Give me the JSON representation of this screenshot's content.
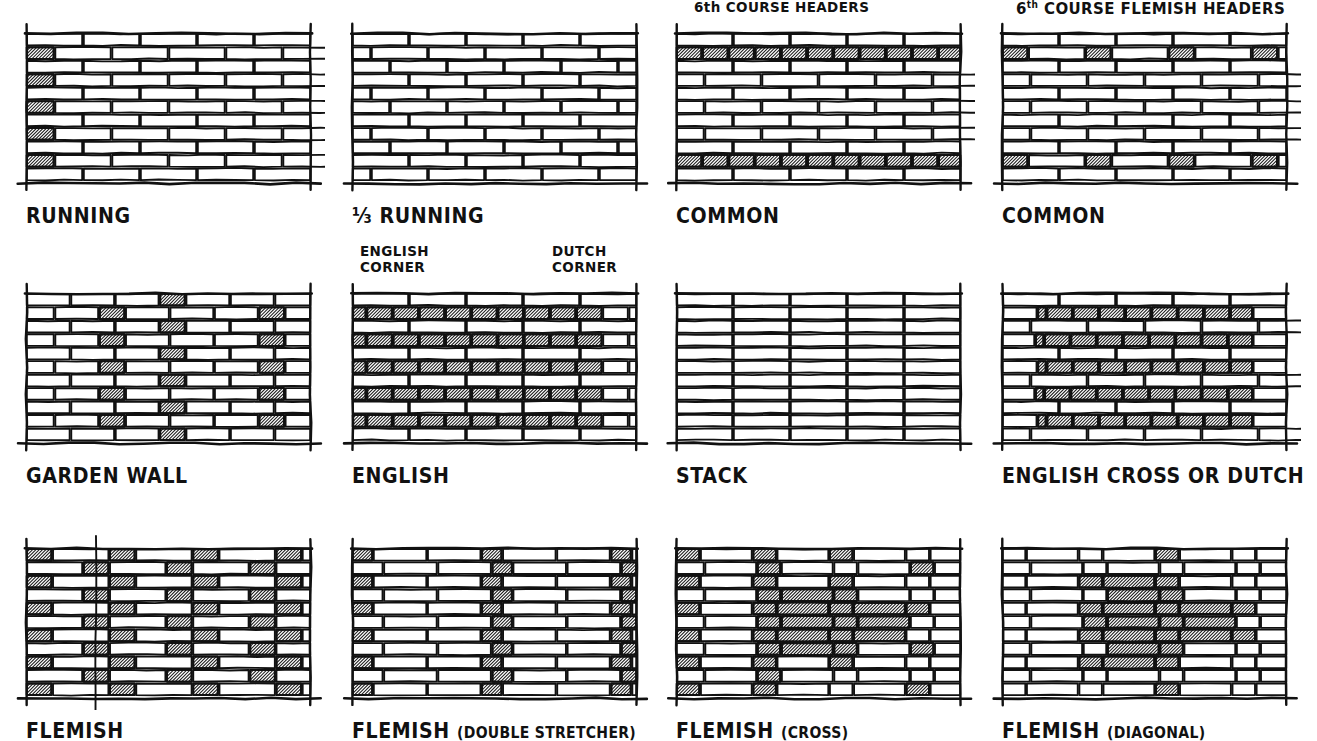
{
  "sheet": {
    "title": "Brick Bond Patterns",
    "ink_color": "#111111",
    "paper_color": "#ffffff",
    "hatch_color": "#1a1a1a",
    "brick_face_color": "#ffffff"
  },
  "panels": [
    {
      "id": "running",
      "caption": "RUNNING",
      "caption_sub": "",
      "annotations": [],
      "pattern": "running",
      "courses": 11,
      "note": "stretcher bond, half-lap; hatched half-bat closers alternate at left and right ends"
    },
    {
      "id": "third-running",
      "caption": "⅓ RUNNING",
      "caption_sub": "",
      "annotations": [],
      "pattern": "third-running",
      "courses": 11,
      "note": "stretcher bond with one-third lap, no hatched bricks"
    },
    {
      "id": "common-headers",
      "caption": "COMMON",
      "caption_sub": "",
      "annotations": [
        {
          "text": "6th COURSE HEADERS",
          "sup": "",
          "x": 18,
          "y": -34
        }
      ],
      "pattern": "common",
      "courses": 11,
      "header_courses": [
        1,
        9
      ],
      "note": "full header course every sixth course, headers hatched"
    },
    {
      "id": "common-flemish-headers",
      "caption": "COMMON",
      "caption_sub": "",
      "annotations": [
        {
          "text": "COURSE FLEMISH HEADERS",
          "sup": "6th",
          "x": 14,
          "y": -34
        }
      ],
      "pattern": "common-flemish",
      "courses": 11,
      "header_courses": [
        1,
        9
      ],
      "note": "every sixth course is Flemish: headers spaced between stretchers"
    },
    {
      "id": "garden-wall",
      "caption": "GARDEN WALL",
      "caption_sub": "",
      "annotations": [],
      "pattern": "garden-wall",
      "courses": 11,
      "note": "three stretchers to one header in every course"
    },
    {
      "id": "english",
      "caption": "ENGLISH",
      "caption_sub": "",
      "annotations": [
        {
          "text": "ENGLISH",
          "sup": "",
          "x": 8,
          "y": -50
        },
        {
          "text": "CORNER",
          "sup": "",
          "x": 8,
          "y": -34
        },
        {
          "text": "DUTCH",
          "sup": "",
          "x": 200,
          "y": -50
        },
        {
          "text": "CORNER",
          "sup": "",
          "x": 200,
          "y": -34
        }
      ],
      "pattern": "english",
      "courses": 11,
      "note": "alternating full header and full stretcher courses"
    },
    {
      "id": "stack",
      "caption": "STACK",
      "caption_sub": "",
      "annotations": [],
      "pattern": "stack",
      "courses": 11,
      "note": "all joints aligned vertically, no hatching"
    },
    {
      "id": "english-cross",
      "caption": "ENGLISH CROSS OR DUTCH",
      "caption_sub": "",
      "annotations": [],
      "pattern": "english-cross",
      "courses": 11,
      "note": "header courses alternate with stretcher courses offset half a brick"
    },
    {
      "id": "flemish",
      "caption": "FLEMISH",
      "caption_sub": "",
      "annotations": [],
      "pattern": "flemish",
      "courses": 11,
      "plumb_line": true,
      "note": "alternating header and stretcher within every course; vertical plumb line drawn"
    },
    {
      "id": "flemish-double-stretcher",
      "caption": "FLEMISH",
      "caption_sub": "(DOUBLE STRETCHER)",
      "annotations": [],
      "pattern": "flemish-double",
      "courses": 11,
      "note": "two stretchers between each header"
    },
    {
      "id": "flemish-cross",
      "caption": "FLEMISH",
      "caption_sub": "(CROSS)",
      "annotations": [],
      "pattern": "flemish-cross",
      "courses": 11,
      "note": "hatched headers arranged to form a diagonal cross motif"
    },
    {
      "id": "flemish-diagonal",
      "caption": "FLEMISH",
      "caption_sub": "(DIAGONAL)",
      "annotations": [],
      "pattern": "flemish-diagonal",
      "courses": 11,
      "note": "hatched bricks massed into a large diamond/diagonal figure"
    }
  ],
  "layout": {
    "columns": 4,
    "rows": 3,
    "column_x": [
      26,
      352,
      676,
      1002
    ],
    "row_y": [
      33,
      293,
      548
    ],
    "wall_width": 285,
    "wall_height": 148,
    "caption_offset_y": 22
  }
}
